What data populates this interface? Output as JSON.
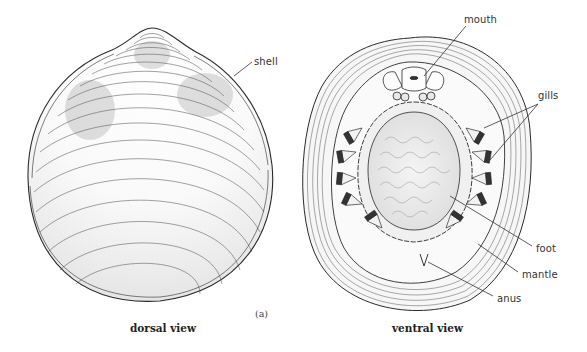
{
  "figure": {
    "panel_label": "(a)",
    "views": [
      {
        "id": "dorsal",
        "caption": "dorsal view",
        "labels": [
          {
            "text": "shell"
          }
        ]
      },
      {
        "id": "ventral",
        "caption": "ventral view",
        "labels": [
          {
            "text": "mouth"
          },
          {
            "text": "gills"
          },
          {
            "text": "foot"
          },
          {
            "text": "mantle"
          },
          {
            "text": "anus"
          }
        ]
      }
    ],
    "colors": {
      "ink": "#2a2a2a",
      "line": "#333333",
      "background": "#ffffff"
    }
  }
}
